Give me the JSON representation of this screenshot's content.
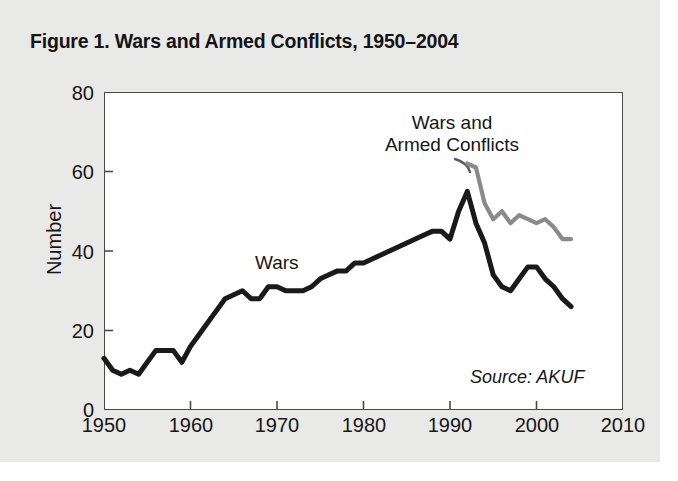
{
  "title": "Figure 1. Wars and Armed Conflicts, 1950–2004",
  "source_note": "Source: AKUF",
  "annotations": {
    "wars": "Wars",
    "conflicts_line1": "Wars and",
    "conflicts_line2": "Armed Conflicts"
  },
  "axes": {
    "ylabel": "Number",
    "yticks": [
      "0",
      "20",
      "40",
      "60",
      "80"
    ],
    "xticks": [
      "1950",
      "1960",
      "1970",
      "1980",
      "1990",
      "2000",
      "2010"
    ]
  },
  "colors": {
    "wars_line": "#1a1a1a",
    "conflicts_line": "#8a8a8a",
    "axis": "#4a4a4a",
    "plot_background": "#ffffff",
    "page_background": "#e9e9e7",
    "text": "#161616"
  },
  "chart_data": {
    "type": "line",
    "title": "Figure 1. Wars and Armed Conflicts, 1950–2004",
    "xlabel": "",
    "ylabel": "Number",
    "xlim": [
      1950,
      2010
    ],
    "ylim": [
      0,
      80
    ],
    "xticks": [
      1950,
      1960,
      1970,
      1980,
      1990,
      2000,
      2010
    ],
    "yticks": [
      0,
      20,
      40,
      60,
      80
    ],
    "grid": false,
    "legend": "annotations-inline",
    "source": "AKUF",
    "series": [
      {
        "name": "Wars",
        "color": "#1a1a1a",
        "x": [
          1950,
          1951,
          1952,
          1953,
          1954,
          1955,
          1956,
          1957,
          1958,
          1959,
          1960,
          1961,
          1962,
          1963,
          1964,
          1965,
          1966,
          1967,
          1968,
          1969,
          1970,
          1971,
          1972,
          1973,
          1974,
          1975,
          1976,
          1977,
          1978,
          1979,
          1980,
          1981,
          1982,
          1983,
          1984,
          1985,
          1986,
          1987,
          1988,
          1989,
          1990,
          1991,
          1992,
          1993,
          1994,
          1995,
          1996,
          1997,
          1998,
          1999,
          2000,
          2001,
          2002,
          2003,
          2004
        ],
        "values": [
          13,
          10,
          9,
          10,
          9,
          12,
          15,
          15,
          15,
          12,
          16,
          19,
          22,
          25,
          28,
          29,
          30,
          28,
          28,
          31,
          31,
          30,
          30,
          30,
          31,
          33,
          34,
          35,
          35,
          37,
          37,
          38,
          39,
          40,
          41,
          42,
          43,
          44,
          45,
          45,
          43,
          50,
          55,
          47,
          42,
          34,
          31,
          30,
          33,
          36,
          36,
          33,
          31,
          28,
          26
        ]
      },
      {
        "name": "Wars and Armed Conflicts",
        "color": "#8a8a8a",
        "x": [
          1992,
          1993,
          1994,
          1995,
          1996,
          1997,
          1998,
          1999,
          2000,
          2001,
          2002,
          2003,
          2004
        ],
        "values": [
          62,
          61,
          52,
          48,
          50,
          47,
          49,
          48,
          47,
          48,
          46,
          43,
          43
        ]
      }
    ]
  }
}
